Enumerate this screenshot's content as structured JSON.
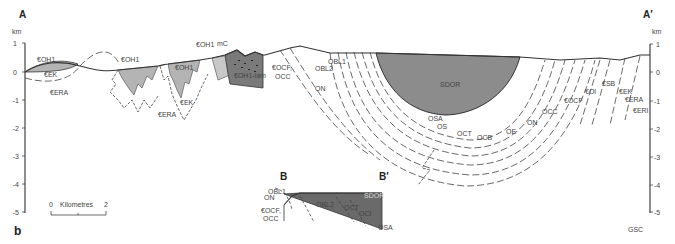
{
  "figure": {
    "panel_label": "b",
    "credit": "GSC",
    "section_main": {
      "start": "A",
      "end": "A′"
    },
    "section_inset": {
      "start": "B",
      "end": "B′"
    }
  },
  "axes": {
    "unit": "km",
    "ticks": [
      "1",
      "0",
      "-1",
      "-2",
      "-3",
      "-4",
      "-5"
    ]
  },
  "scale_bar": {
    "min": "0",
    "label": "Kilometres",
    "max": "2"
  },
  "units_main": {
    "coh1_a": "€OH1",
    "cek_a": "€EK",
    "cera_a": "€ERA",
    "coh1_b": "€OH1",
    "coh1_c": "€OH1",
    "cek_b": "€EK",
    "cera_b": "€ERA",
    "coh1_d": "€OH1",
    "mc": "mC",
    "coh1_lam": "€OH1-lam",
    "cocf": "€OCF,",
    "occ_a": "OCC",
    "obl2": "OBL2",
    "on_a": "ON",
    "obl1": "OBL1",
    "sdor": "SDOR",
    "osa": "OSA",
    "os": "OS",
    "oct": "OCT",
    "ocb": "OCB",
    "oe": "OE",
    "on_b": "ON",
    "occ_b": "OCC",
    "cocf_b": "€OCF",
    "col": "€OI",
    "csb": "€SB",
    "cek_c": "€EK",
    "cera_c": "€ERA",
    "ceri": "€ERI"
  },
  "units_inset": {
    "obl1": "OBL1",
    "on": "ON",
    "cocf": "€OCF,",
    "occ": "OCC",
    "obl2": "OBL2",
    "oct": "OCT",
    "oci": "OCI",
    "osa": "OSA",
    "sdor": "SDOR"
  },
  "colors": {
    "light_fill": "#b4b4b4",
    "dark_fill": "#8c8c8c",
    "lam_fill": "#7a7a7a",
    "line": "#333333"
  }
}
